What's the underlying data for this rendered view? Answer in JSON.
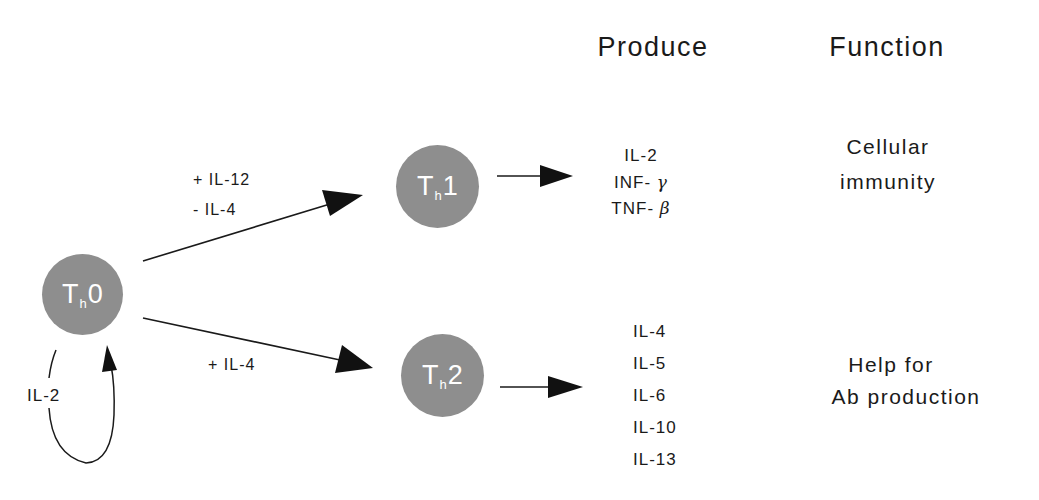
{
  "headers": {
    "produce": "Produce",
    "function": "Function"
  },
  "cells": {
    "th0": {
      "main": "T",
      "sub": "h",
      "suffix": "0"
    },
    "th1": {
      "main": "T",
      "sub": "h",
      "suffix": "1"
    },
    "th2": {
      "main": "T",
      "sub": "h",
      "suffix": "2"
    }
  },
  "conditions": {
    "to_th1": [
      "+ IL-12",
      "- IL-4"
    ],
    "to_th2": "+ IL-4",
    "autocrine": "IL-2"
  },
  "th1_products": [
    {
      "prefix": "IL-2",
      "greek": ""
    },
    {
      "prefix": "INF- ",
      "greek": "γ"
    },
    {
      "prefix": "TNF- ",
      "greek": "β"
    }
  ],
  "th2_products": [
    "IL-4",
    "IL-5",
    "IL-6",
    "IL-10",
    "IL-13"
  ],
  "functions": {
    "th1": [
      "Cellular",
      "immunity"
    ],
    "th2": [
      "Help for",
      "Ab production"
    ]
  },
  "colors": {
    "cell_fill": "#8e8e8e",
    "cell_text": "#ffffff",
    "line": "#1a1a1a"
  }
}
